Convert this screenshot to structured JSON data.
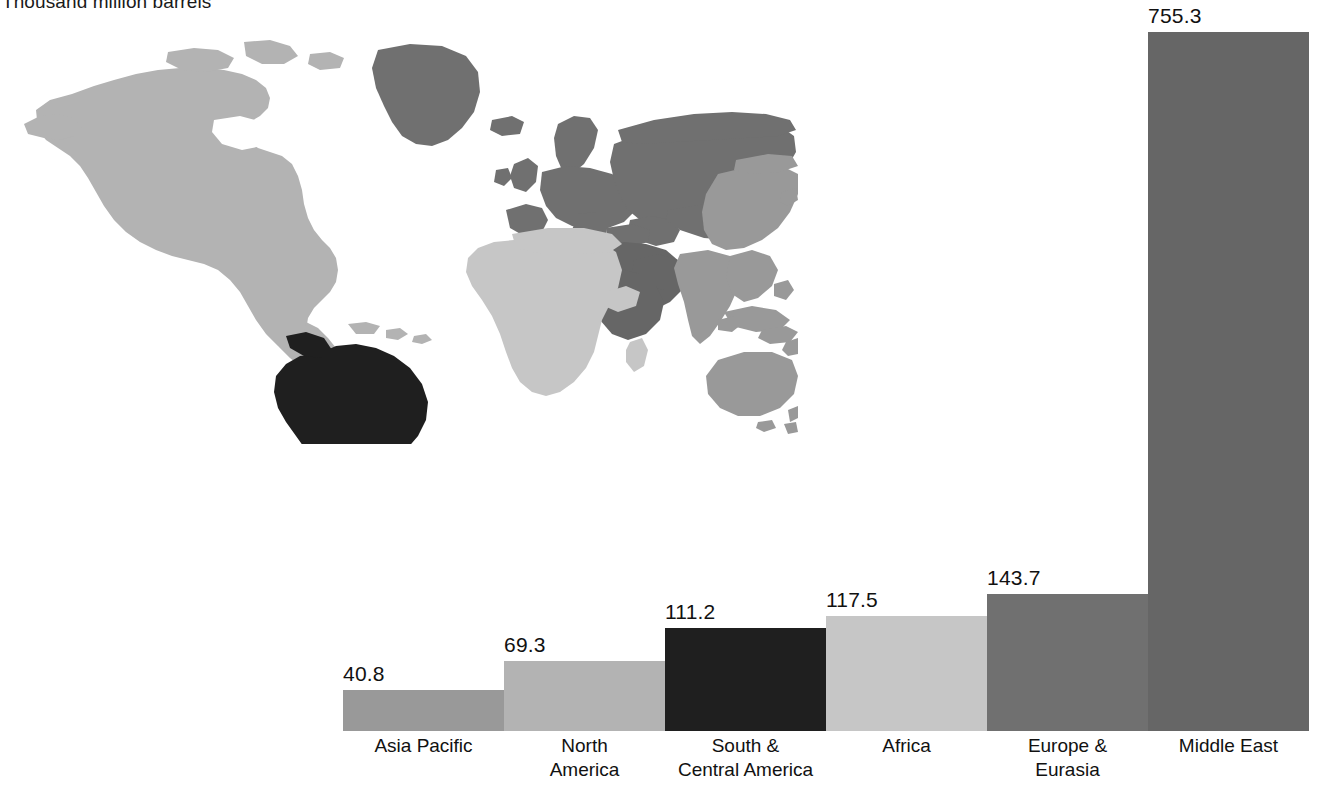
{
  "chart_data": {
    "type": "bar",
    "title": "Thousand million barrels",
    "subtitle": "",
    "xlabel": "",
    "ylabel": "Thousand million barrels",
    "categories": [
      "Asia Pacific",
      "North America",
      "South & Central America",
      "Africa",
      "Europe & Eurasia",
      "Middle East"
    ],
    "category_lines": [
      [
        "Asia Pacific"
      ],
      [
        "North",
        "America"
      ],
      [
        "South &",
        "Central America"
      ],
      [
        "Africa"
      ],
      [
        "Europe &",
        "Eurasia"
      ],
      [
        "Middle East"
      ]
    ],
    "values": [
      40.8,
      69.3,
      111.2,
      117.5,
      143.7,
      755.3
    ],
    "value_labels": [
      "40.8",
      "69.3",
      "111.2",
      "117.5",
      "143.7",
      "755.3"
    ],
    "colors": [
      "#999999",
      "#b3b3b3",
      "#1f1f1f",
      "#c6c6c6",
      "#707070",
      "#666666"
    ],
    "bar_pixel_heights": [
      41,
      70,
      103,
      115,
      137,
      699
    ],
    "grid": false,
    "legend": "none",
    "axis_visible": false,
    "ylim": [
      0,
      790
    ],
    "units": "thousand million barrels"
  },
  "map": {
    "name": "world-choropleth",
    "region_fills": {
      "north_america": "#b3b3b3",
      "south_central_america": "#1f1f1f",
      "europe_eurasia": "#707070",
      "africa": "#c6c6c6",
      "middle_east": "#666666",
      "asia_pacific": "#999999"
    },
    "background": "#ffffff"
  }
}
